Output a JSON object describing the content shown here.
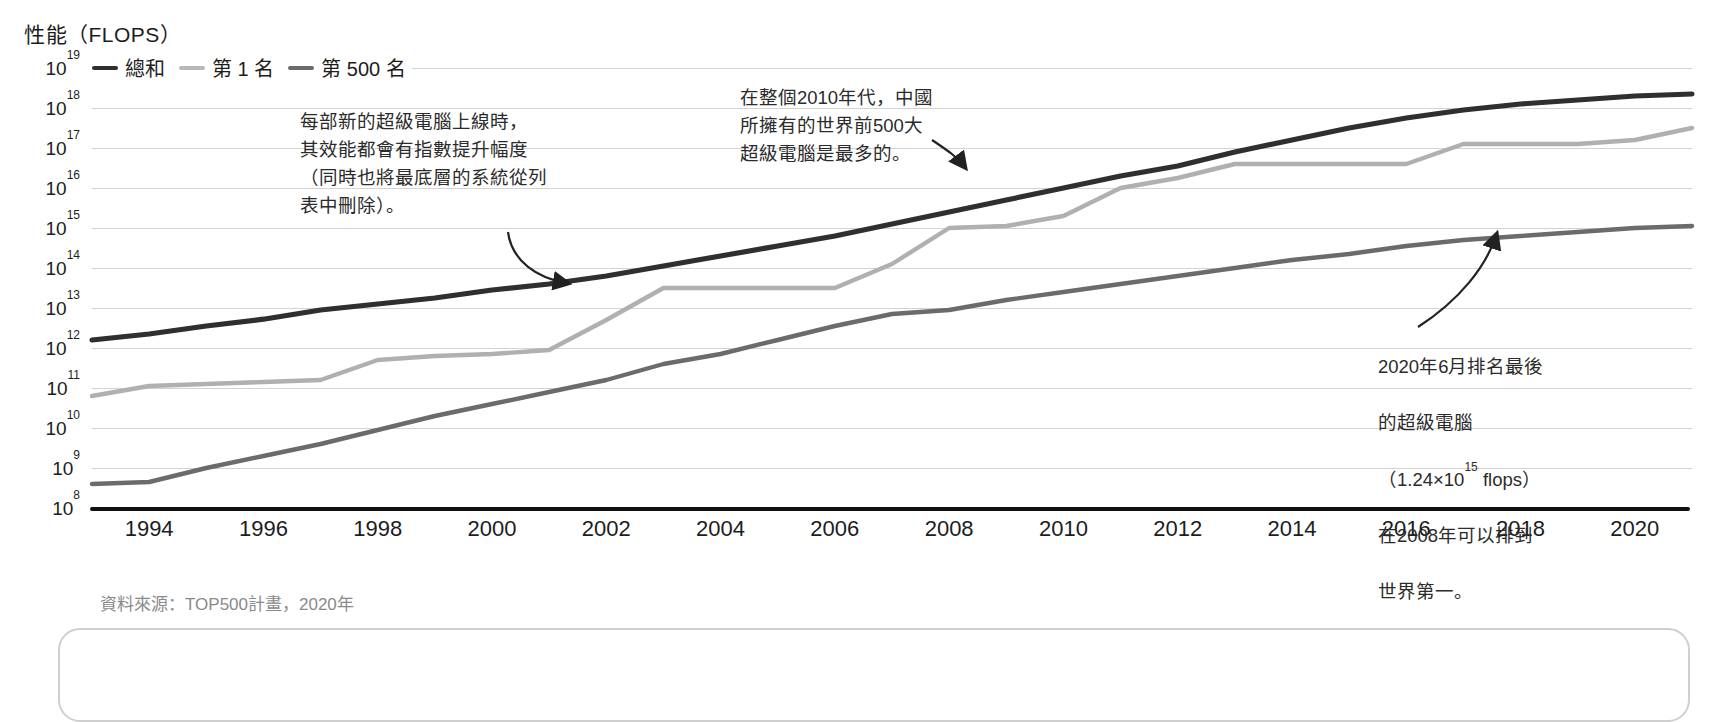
{
  "chart_data": {
    "type": "line",
    "title": "性能（FLOPS）",
    "ylabel": "性能（FLOPS）",
    "xlabel": "",
    "grid": true,
    "legend_position": "top-left",
    "x": [
      1993,
      1994,
      1995,
      1996,
      1997,
      1998,
      1999,
      2000,
      2001,
      2002,
      2003,
      2004,
      2005,
      2006,
      2007,
      2008,
      2009,
      2010,
      2011,
      2012,
      2013,
      2014,
      2015,
      2016,
      2017,
      2018,
      2019,
      2020,
      2021
    ],
    "xlim": [
      1993,
      2021
    ],
    "ylim_log10": [
      8,
      19
    ],
    "yticks": [
      "10^8",
      "10^9",
      "10^10",
      "10^11",
      "10^12",
      "10^13",
      "10^14",
      "10^15",
      "10^16",
      "10^17",
      "10^18",
      "10^19"
    ],
    "xticks": [
      "1994",
      "1996",
      "1998",
      "2000",
      "2002",
      "2004",
      "2006",
      "2008",
      "2010",
      "2012",
      "2014",
      "2016",
      "2018",
      "2020"
    ],
    "series": [
      {
        "name": "總和",
        "color": "#2f2f2f",
        "values_log10": [
          12.2,
          12.35,
          12.55,
          12.72,
          12.95,
          13.1,
          13.25,
          13.45,
          13.6,
          13.8,
          14.05,
          14.3,
          14.55,
          14.8,
          15.1,
          15.4,
          15.7,
          16.0,
          16.3,
          16.55,
          16.9,
          17.2,
          17.5,
          17.75,
          17.95,
          18.1,
          18.2,
          18.3,
          18.35
        ]
      },
      {
        "name": "第1名",
        "color": "#b0b0b0",
        "values_log10": [
          10.8,
          11.05,
          11.1,
          11.15,
          11.2,
          11.7,
          11.8,
          11.85,
          11.95,
          12.7,
          13.5,
          13.5,
          13.5,
          13.5,
          14.1,
          15.0,
          15.05,
          15.3,
          16.0,
          16.25,
          16.6,
          16.6,
          16.6,
          16.6,
          17.1,
          17.1,
          17.1,
          17.2,
          17.5
        ]
      },
      {
        "name": "第 500 名",
        "color": "#6b6b6b",
        "values_log10": [
          8.6,
          8.65,
          9.0,
          9.3,
          9.6,
          9.95,
          10.3,
          10.6,
          10.9,
          11.2,
          11.6,
          11.85,
          12.2,
          12.55,
          12.85,
          12.95,
          13.2,
          13.4,
          13.6,
          13.8,
          14.0,
          14.2,
          14.35,
          14.55,
          14.7,
          14.8,
          14.9,
          15.0,
          15.05
        ]
      }
    ],
    "annotations": [
      {
        "id": "annot-1",
        "text": "每部新的超級電腦上線時，\n其效能都會有指數提升幅度\n（同時也將最底層的系統從列\n表中刪除）。"
      },
      {
        "id": "annot-2",
        "text": "在整個2010年代，中國\n所擁有的世界前500大\n超級電腦是最多的。"
      },
      {
        "id": "annot-3",
        "line1": "2020年6月排名最後",
        "line2": "的超級電腦",
        "line3_pre": "（1.24×10",
        "line3_sup": "15",
        "line3_post": " flops）",
        "line4": "在2008年可以排到",
        "line5": "世界第一。"
      }
    ],
    "source_note": "資料來源：TOP500計畫，2020年"
  },
  "header": {
    "axis_title": "性能（FLOPS）"
  },
  "legend": {
    "items": [
      {
        "label": "總和",
        "color": "#2f2f2f"
      },
      {
        "label": "第 1 名",
        "color": "#b8b8b8"
      },
      {
        "label": "第 500 名",
        "color": "#6b6b6b"
      }
    ]
  },
  "yaxis": {
    "ticks": [
      {
        "base": "10",
        "exp": "19"
      },
      {
        "base": "10",
        "exp": "18"
      },
      {
        "base": "10",
        "exp": "17"
      },
      {
        "base": "10",
        "exp": "16"
      },
      {
        "base": "10",
        "exp": "15"
      },
      {
        "base": "10",
        "exp": "14"
      },
      {
        "base": "10",
        "exp": "13"
      },
      {
        "base": "10",
        "exp": "12"
      },
      {
        "base": "10",
        "exp": "11"
      },
      {
        "base": "10",
        "exp": "10"
      },
      {
        "base": "10",
        "exp": "9"
      },
      {
        "base": "10",
        "exp": "8"
      }
    ]
  },
  "xaxis": {
    "ticks": [
      "1994",
      "1996",
      "1998",
      "2000",
      "2002",
      "2004",
      "2006",
      "2008",
      "2010",
      "2012",
      "2014",
      "2016",
      "2018",
      "2020"
    ]
  },
  "footer": {
    "source": "資料來源：TOP500計畫，2020年"
  }
}
